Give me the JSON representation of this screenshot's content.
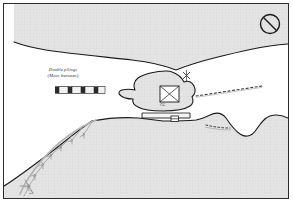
{
  "figure": {
    "kind": "nautical-harbor-chart",
    "width": 293,
    "height": 213,
    "background_color": "#ffffff",
    "frame_color": "#2b2b2b"
  },
  "colors": {
    "land_fill": "#e3e3e3",
    "land_fill_alt": "#e8e8e8",
    "shoreline": "#1a1a1a",
    "ink": "#2e2e2e",
    "arc_gray": "#b5b5b5",
    "piling_dark": "#2a2a2a",
    "piling_light": "#f2f2f2",
    "dotted_pier": "#3a3a3a"
  },
  "legend": {
    "note_line_1": "Double pilings",
    "note_line_2": "(Moor between)",
    "symbol_name": "double-piling-symbol",
    "symbol_segments": 4
  },
  "labels": {
    "building_marker": "CG"
  },
  "symbols": {
    "prohibition": {
      "name": "no-entry-symbol",
      "cx": 270,
      "cy": 24,
      "r": 10
    },
    "channel_marker": {
      "name": "cross-marker",
      "x": 186,
      "y": 75
    },
    "bridge_marker": {
      "name": "bridge-marker",
      "x": 175,
      "y": 119
    }
  },
  "chart_features": [
    {
      "name": "north-shoreline",
      "type": "shoreline"
    },
    {
      "name": "island-landmass",
      "type": "island"
    },
    {
      "name": "south-mainland",
      "type": "shoreline"
    },
    {
      "name": "east-shoreline-bay",
      "type": "shoreline"
    },
    {
      "name": "causeway-bridge",
      "type": "bridge"
    },
    {
      "name": "east-pier-dotted",
      "type": "pier"
    },
    {
      "name": "southeast-pier-dotted",
      "type": "pier"
    },
    {
      "name": "breakwater-arc",
      "type": "breakwater",
      "tick_count": 8
    },
    {
      "name": "square-building",
      "type": "structure"
    }
  ]
}
